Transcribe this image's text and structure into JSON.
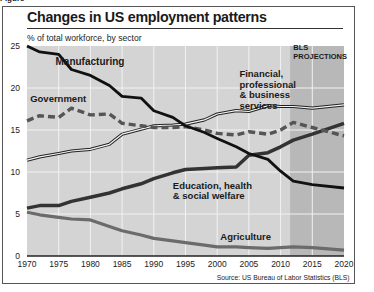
{
  "figure_label": "Figure",
  "title": "Changes in US employment patterns",
  "subtitle": "% of total workforce, by sector",
  "source": "Source: US Bureau of Labor Statistics (BLS)",
  "projection_label_line1": "BLS",
  "projection_label_line2": "PROJECTIONS",
  "colors": {
    "plot_bg": "#d4d4d4",
    "projection_bg": "#b8b8b8",
    "grid": "#f2f2f2",
    "manufacturing": "#111111",
    "government": "#555555",
    "financial": "#222222",
    "education": "#333333",
    "agriculture": "#6b6b6b"
  },
  "chart_data": {
    "type": "line",
    "title": "Changes in US employment patterns",
    "subtitle": "% of total workforce, by sector",
    "xlabel": "",
    "ylabel": "% of total workforce",
    "xlim": [
      1970,
      2020
    ],
    "ylim": [
      0,
      25
    ],
    "x_ticks": [
      "1970",
      "1975",
      "1980",
      "1985",
      "1990",
      "1995",
      "2000",
      "2005",
      "2010",
      "2015",
      "2020"
    ],
    "y_ticks": [
      "0",
      "5",
      "10",
      "15",
      "20",
      "25"
    ],
    "grid": true,
    "legend": "inline labels",
    "projection_region": {
      "start": 2011.5,
      "end": 2020,
      "label": "BLS PROJECTIONS"
    },
    "x": [
      1970,
      1972,
      1975,
      1977,
      1980,
      1983,
      1985,
      1988,
      1990,
      1993,
      1995,
      1998,
      2000,
      2003,
      2005,
      2008,
      2010,
      2012,
      2015,
      2020
    ],
    "series": [
      {
        "name": "Manufacturing",
        "style": "solid thick black",
        "values": [
          25.0,
          24.3,
          24.0,
          22.2,
          21.5,
          20.3,
          19.0,
          18.8,
          17.3,
          16.5,
          15.5,
          14.7,
          14.0,
          13.0,
          12.2,
          11.5,
          10.1,
          8.9,
          8.5,
          8.1
        ]
      },
      {
        "name": "Government",
        "style": "dashed gray",
        "values": [
          16.1,
          16.7,
          16.5,
          17.6,
          16.8,
          16.9,
          15.8,
          15.5,
          15.3,
          15.3,
          15.4,
          15.0,
          14.6,
          14.4,
          14.8,
          14.5,
          15.0,
          15.9,
          15.3,
          14.3
        ]
      },
      {
        "name": "Financial, professional & business services",
        "style": "double line",
        "values": [
          11.4,
          11.8,
          12.2,
          12.5,
          12.7,
          13.3,
          14.5,
          15.1,
          15.5,
          15.6,
          15.7,
          16.2,
          16.9,
          17.3,
          17.2,
          17.9,
          17.8,
          17.8,
          17.6,
          18.0
        ]
      },
      {
        "name": "Education, health & social welfare",
        "style": "solid thick dark",
        "values": [
          5.7,
          6.0,
          6.0,
          6.5,
          7.0,
          7.5,
          8.0,
          8.6,
          9.2,
          9.9,
          10.3,
          10.4,
          10.5,
          10.6,
          12.0,
          12.3,
          13.0,
          13.8,
          14.5,
          15.8
        ]
      },
      {
        "name": "Agriculture",
        "style": "solid medium gray",
        "values": [
          5.2,
          4.9,
          4.6,
          4.4,
          4.3,
          3.5,
          3.0,
          2.5,
          2.1,
          1.8,
          1.6,
          1.3,
          1.1,
          1.1,
          1.0,
          0.9,
          1.0,
          1.1,
          1.0,
          0.7
        ]
      }
    ],
    "annotations": [
      {
        "text": "Manufacturing",
        "x": 1974.5,
        "y": 22.7
      },
      {
        "text": "Government",
        "x": 1970.5,
        "y": 18.3
      },
      {
        "text": "Financial, professional & business services",
        "x": 2003.5,
        "y": 21.3
      },
      {
        "text": "Education, health & social welfare",
        "x": 1993,
        "y": 8.0
      },
      {
        "text": "Agriculture",
        "x": 2000.5,
        "y": 1.9
      },
      {
        "text": "BLS PROJECTIONS",
        "x": 2012,
        "y": 24.5
      }
    ]
  }
}
